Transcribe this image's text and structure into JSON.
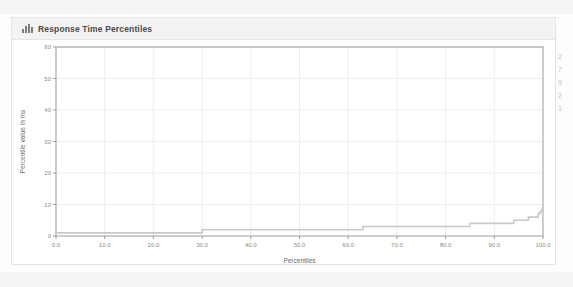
{
  "panel": {
    "title": "Response Time Percentiles",
    "icon": "bar-chart-icon"
  },
  "edge_fragment": {
    "lines": [
      "2",
      "7",
      "9",
      "2",
      "1"
    ]
  },
  "colors": {
    "panel_bg": "#ffffff",
    "header_bg": "#f3f3f3",
    "border": "#e4e4e4",
    "axis": "#9a9a9a",
    "grid": "#ededed",
    "series": "#c9c9c9",
    "tick_text": "#8a8a8a"
  },
  "chart_data": {
    "type": "line",
    "title": "Response Time Percentiles",
    "xlabel": "Percentiles",
    "ylabel": "Percentile value in ms",
    "xlim": [
      0,
      100
    ],
    "ylim": [
      0,
      60
    ],
    "xticks": [
      "0.0",
      "10.0",
      "20.0",
      "30.0",
      "40.0",
      "50.0",
      "60.0",
      "70.0",
      "80.0",
      "90.0",
      "100.0"
    ],
    "xtick_values": [
      0,
      10,
      20,
      30,
      40,
      50,
      60,
      70,
      80,
      90,
      100
    ],
    "yticks": [
      "0",
      "10",
      "20",
      "30",
      "40",
      "50",
      "60"
    ],
    "ytick_values": [
      0,
      10,
      20,
      30,
      40,
      50,
      60
    ],
    "grid": true,
    "legend": "none",
    "series": [
      {
        "name": "Response time percentile",
        "x": [
          0,
          5,
          10,
          15,
          20,
          25,
          29.5,
          30,
          40,
          50,
          60,
          62.5,
          63,
          70,
          75,
          80,
          84.5,
          85,
          88,
          90,
          92,
          93.5,
          94,
          95,
          96,
          96.5,
          97,
          97.5,
          98,
          98.5,
          99,
          99.3,
          99.6,
          99.8,
          99.9,
          100
        ],
        "y": [
          1,
          1,
          1,
          1,
          1,
          1,
          1,
          2,
          2,
          2,
          2,
          2,
          3,
          3,
          3,
          3,
          3,
          4,
          4,
          4,
          4,
          4,
          5,
          5,
          5,
          5,
          6,
          6,
          6,
          6,
          7,
          7.5,
          8,
          8.5,
          9,
          9
        ]
      }
    ]
  }
}
